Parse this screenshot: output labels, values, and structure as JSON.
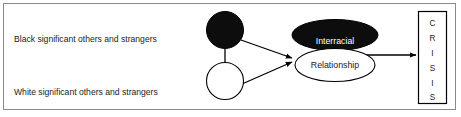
{
  "figure": {
    "border_color": "#7a7a7a",
    "background": "#ffffff",
    "stroke_color": "#000000",
    "fill_dark": "#0d0d0d",
    "fill_light": "#ffffff",
    "text_color": "#1a1a1a",
    "text_on_dark": "#ffffff"
  },
  "labels": {
    "black_group": "Black significant others and strangers",
    "white_group": "White significant others and strangers"
  },
  "nodes": {
    "black_circle": {
      "name": "black-circle",
      "fill": "#0d0d0d",
      "label": ""
    },
    "white_circle": {
      "name": "white-circle",
      "fill": "#ffffff",
      "label": ""
    },
    "interracial_ellipse": {
      "name": "interracial-ellipse",
      "fill": "#0d0d0d",
      "label": "Interracial"
    },
    "relationship_ellipse": {
      "name": "relationship-ellipse",
      "fill": "#ffffff",
      "label": "Relationship"
    }
  },
  "crisis_box": {
    "label": "CRISIS",
    "letters": [
      "C",
      "R",
      "I",
      "S",
      "I",
      "S"
    ],
    "orientation": "vertical"
  },
  "connectors": [
    {
      "from": "black-circle",
      "to": "relationship-ellipse",
      "arrow": true
    },
    {
      "from": "white-circle",
      "to": "relationship-ellipse",
      "arrow": true
    },
    {
      "from": "black-circle",
      "to": "white-circle",
      "arrow": false
    },
    {
      "from": "interracial-relationship",
      "to": "crisis-box",
      "arrow": true
    }
  ]
}
